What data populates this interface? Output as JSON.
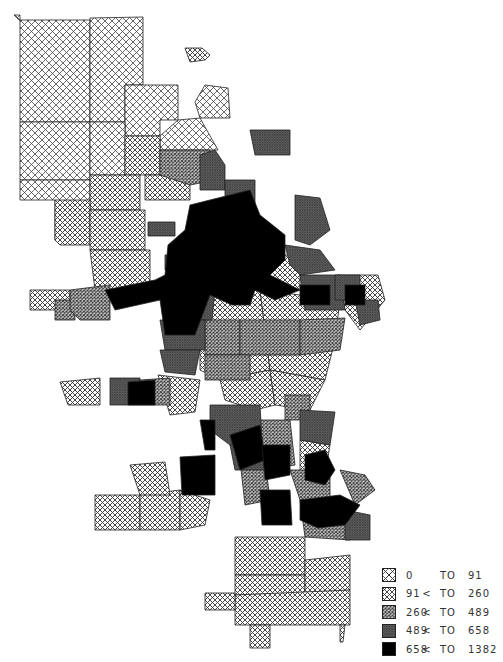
{
  "map": {
    "subject": "choropleth map of city census tracts",
    "legend": {
      "classes": [
        {
          "low": "0",
          "op": "",
          "to": "TO",
          "high": "91",
          "pattern": "pat-sparse",
          "fill": "#ffffff"
        },
        {
          "low": "91",
          "op": "<",
          "to": "TO",
          "high": "260",
          "pattern": "pat-light",
          "fill": "#f4f4f4"
        },
        {
          "low": "260",
          "op": "<",
          "to": "TO",
          "high": "489",
          "pattern": "pat-medium",
          "fill": "#bdbdbd"
        },
        {
          "low": "489",
          "op": "<",
          "to": "TO",
          "high": "658",
          "pattern": "pat-dense",
          "fill": "#6f6f6f"
        },
        {
          "low": "658",
          "op": "<",
          "to": "TO",
          "high": "1382",
          "pattern": "pat-solid",
          "fill": "#000000"
        }
      ]
    }
  }
}
